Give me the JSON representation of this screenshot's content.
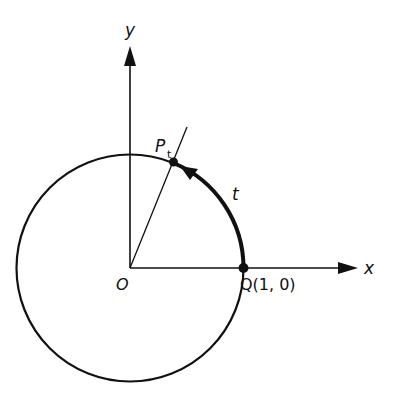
{
  "diagram": {
    "type": "unit-circle",
    "labels": {
      "y_axis": "y",
      "x_axis": "x",
      "origin": "O",
      "point_p": "P",
      "point_p_sub": "t",
      "arc": "t",
      "point_q": "Q(1, 0)"
    },
    "colors": {
      "ink": "#111111",
      "background": "#ffffff"
    }
  }
}
